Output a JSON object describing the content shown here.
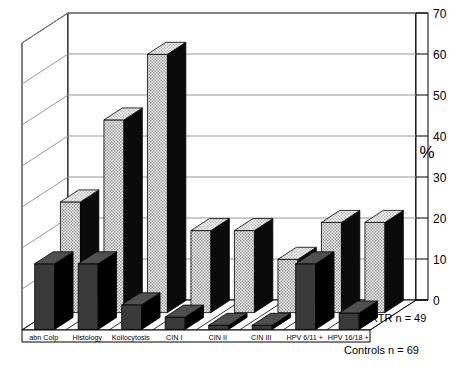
{
  "chart_data": {
    "type": "bar",
    "title": "",
    "subtitle": "",
    "xlabel": "",
    "ylabel": "%",
    "ylim": [
      0,
      70
    ],
    "yticks": [
      0,
      10,
      20,
      30,
      40,
      50,
      60,
      70
    ],
    "ytick_labels": [
      "0",
      "10",
      "20",
      "30",
      "40",
      "50",
      "60",
      "70"
    ],
    "grid": true,
    "three_d": true,
    "legend_position": "right-floor",
    "categories": [
      "abn Colp",
      "Histology",
      "Koilocytosis",
      "CIN I",
      "CIN II",
      "CIN III",
      "HPV 6/11 +",
      "HPV 16/18 +"
    ],
    "series": [
      {
        "name": "RTR n = 49",
        "fill": "hatched-grey",
        "values": [
          27,
          47,
          63,
          20,
          20,
          13,
          22,
          22
        ]
      },
      {
        "name": "Controls n = 69",
        "fill": "solid-dark",
        "values": [
          16,
          16,
          6,
          3,
          1,
          1,
          16,
          4
        ]
      }
    ],
    "annotations": []
  },
  "axis": {
    "percent_symbol": "%"
  },
  "colors": {
    "background": "#ffffff",
    "outline": "#000000",
    "gridline": "#8c8c8c",
    "front_bar_face": "#3a3a3a",
    "front_bar_side": "#000000",
    "front_bar_top": "#4f4f4f",
    "back_bar_face": "#b5b5b5",
    "back_bar_side": "#0a0a0a",
    "back_bar_top": "#cdcdcd"
  }
}
